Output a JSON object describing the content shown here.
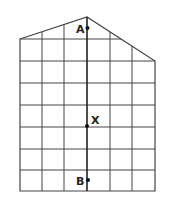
{
  "diagram": {
    "colors": {
      "line": "#444444",
      "axis": "#222222",
      "background": "#ffffff"
    },
    "points": [
      {
        "label": "A",
        "x": 87,
        "y": 28
      },
      {
        "label": "X",
        "x": 87,
        "y": 126
      },
      {
        "label": "B",
        "x": 87,
        "y": 180
      }
    ],
    "grid": {
      "columns": 6,
      "rows": 7
    }
  }
}
